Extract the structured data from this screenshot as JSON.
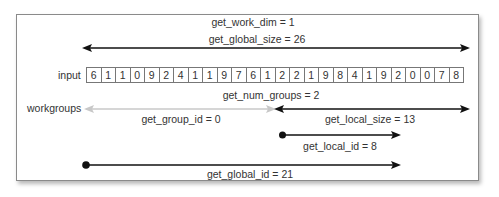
{
  "diagram": {
    "work_dim_label": "get_work_dim = 1",
    "global_size_label": "get_global_size = 26",
    "input_label": "input",
    "input_values": [
      "6",
      "1",
      "1",
      "0",
      "9",
      "2",
      "4",
      "1",
      "1",
      "9",
      "7",
      "6",
      "1",
      "2",
      "2",
      "1",
      "9",
      "8",
      "4",
      "1",
      "9",
      "2",
      "0",
      "0",
      "7",
      "8"
    ],
    "num_groups_label": "get_num_groups = 2",
    "workgroups_label": "workgroups",
    "group_id_label": "get_group_id = 0",
    "local_size_label": "get_local_size = 13",
    "local_id_label": "get_local_id = 8",
    "global_id_label": "get_global_id = 21"
  },
  "colors": {
    "line_dark": "#111111",
    "line_light": "#c8c8c8",
    "text": "#333333",
    "border": "#8a8a8a"
  }
}
